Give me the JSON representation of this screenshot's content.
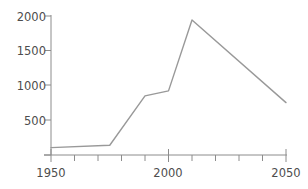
{
  "chart_data": {
    "type": "line",
    "title": "",
    "subtitle": "",
    "xlabel": "",
    "ylabel": "",
    "x": [
      1950,
      1975,
      1990,
      2000,
      2010,
      2050
    ],
    "values": [
      110,
      145,
      880,
      955,
      2010,
      780
    ],
    "series": [
      {
        "name": "",
        "x": [
          1950,
          1975,
          1990,
          2000,
          2010,
          2050
        ],
        "values": [
          110,
          145,
          880,
          955,
          2010,
          780
        ]
      }
    ],
    "xlim": [
      1950,
      2050
    ],
    "ylim": [
      0,
      2080
    ],
    "x_ticks_major": [
      1950,
      2000,
      2050
    ],
    "x_ticks_minor": [
      1960,
      1970,
      1980,
      1990,
      2010,
      2020,
      2030,
      2040
    ],
    "x_tick_labels": [
      "1950",
      "2000",
      "2050"
    ],
    "y_ticks": [
      500,
      1000,
      1500,
      2000
    ],
    "y_tick_labels": [
      "500",
      "1000",
      "1500",
      "2000"
    ],
    "grid": false,
    "legend": "none",
    "annotations": [],
    "line_color": "#999999",
    "axis_color": "#808080",
    "text_color": "#4d4d4d"
  },
  "axes": {
    "y_tick_labels": [
      {
        "text": "2000",
        "top": 10,
        "right": 262
      },
      {
        "text": "1500",
        "top": 44,
        "right": 262
      },
      {
        "text": "1000",
        "top": 79,
        "right": 262
      },
      {
        "text": "500",
        "top": 114,
        "right": 262
      }
    ],
    "x_tick_labels": [
      {
        "text": "1950",
        "left": 28,
        "top": 166
      },
      {
        "text": "2000",
        "left": 145,
        "top": 166
      },
      {
        "text": "2050",
        "left": 263,
        "top": 166
      }
    ]
  }
}
